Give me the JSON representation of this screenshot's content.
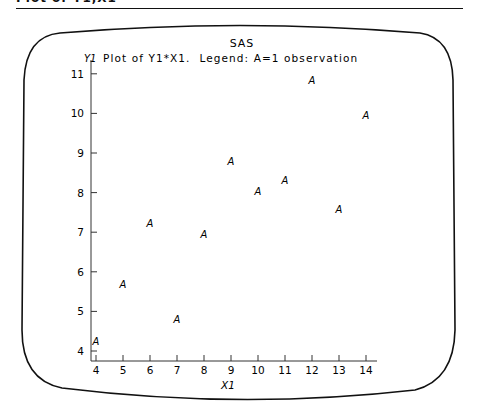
{
  "page": {
    "header_text": "Plot of Y1,X1"
  },
  "screen": {
    "system_title": "SAS",
    "y_axis_name": "Y1",
    "plot_title": "Plot of Y1*X1.  Legend: A=1 observation",
    "marker_symbol": "A"
  },
  "chart_data": {
    "type": "scatter",
    "title": "Plot of Y1*X1.  Legend: A=1 observation",
    "subtitle": "SAS",
    "xlabel": "X1",
    "ylabel": "Y1",
    "xlim": [
      4,
      14
    ],
    "ylim": [
      4,
      11
    ],
    "x_ticks": [
      4,
      5,
      6,
      7,
      8,
      9,
      10,
      11,
      12,
      13,
      14
    ],
    "y_ticks": [
      4,
      5,
      6,
      7,
      8,
      9,
      10,
      11
    ],
    "grid": false,
    "legend": "A=1 observation",
    "marker": "A",
    "points": [
      {
        "x": 10,
        "y": 8.04
      },
      {
        "x": 8,
        "y": 6.95
      },
      {
        "x": 13,
        "y": 7.58
      },
      {
        "x": 9,
        "y": 8.81
      },
      {
        "x": 11,
        "y": 8.33
      },
      {
        "x": 14,
        "y": 9.96
      },
      {
        "x": 6,
        "y": 7.24
      },
      {
        "x": 4,
        "y": 4.26
      },
      {
        "x": 12,
        "y": 10.84
      },
      {
        "x": 7,
        "y": 4.82
      },
      {
        "x": 5,
        "y": 5.68
      }
    ]
  }
}
